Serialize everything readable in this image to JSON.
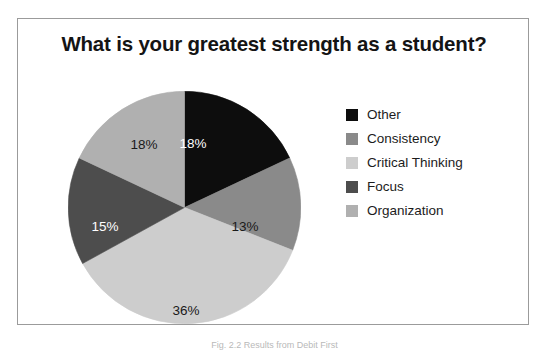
{
  "figure": {
    "title": "What is your greatest strength as a student?",
    "caption": "Fig. 2.2 Results from Debit First"
  },
  "chart_data": {
    "type": "pie",
    "title": "What is your greatest strength as a student?",
    "xlabel": "",
    "ylabel": "",
    "legend_position": "right",
    "start_angle_deg": 0,
    "direction": "clockwise",
    "categories": [
      "Other",
      "Consistency",
      "Critical Thinking",
      "Focus",
      "Organization"
    ],
    "values": [
      18,
      13,
      36,
      15,
      18
    ],
    "value_labels": [
      "18%",
      "13%",
      "36%",
      "15%",
      "18%"
    ],
    "colors": [
      "#0d0d0d",
      "#8a8a8a",
      "#cdcdcd",
      "#4d4d4d",
      "#b0b0b0"
    ],
    "label_text_colors": [
      "#ffffff",
      "#1a1a1a",
      "#1a1a1a",
      "#ffffff",
      "#1a1a1a"
    ],
    "slices": [
      {
        "name": "Other",
        "value": 18,
        "label": "18%",
        "color": "#0d0d0d",
        "label_color": "on-dark",
        "lx": 125,
        "ly": 52
      },
      {
        "name": "Consistency",
        "value": 13,
        "label": "13%",
        "color": "#8a8a8a",
        "label_color": "on-light",
        "lx": 177,
        "ly": 135
      },
      {
        "name": "Critical Thinking",
        "value": 36,
        "label": "36%",
        "color": "#cdcdcd",
        "label_color": "on-light",
        "lx": 118,
        "ly": 219
      },
      {
        "name": "Focus",
        "value": 15,
        "label": "15%",
        "color": "#4d4d4d",
        "label_color": "on-dark",
        "lx": 37,
        "ly": 135
      },
      {
        "name": "Organization",
        "value": 18,
        "label": "18%",
        "color": "#b0b0b0",
        "label_color": "on-light",
        "lx": 76,
        "ly": 53
      }
    ]
  },
  "legend": {
    "items": [
      {
        "label": "Other",
        "color": "#0d0d0d"
      },
      {
        "label": "Consistency",
        "color": "#8a8a8a"
      },
      {
        "label": "Critical Thinking",
        "color": "#cdcdcd"
      },
      {
        "label": "Focus",
        "color": "#4d4d4d"
      },
      {
        "label": "Organization",
        "color": "#b0b0b0"
      }
    ]
  }
}
